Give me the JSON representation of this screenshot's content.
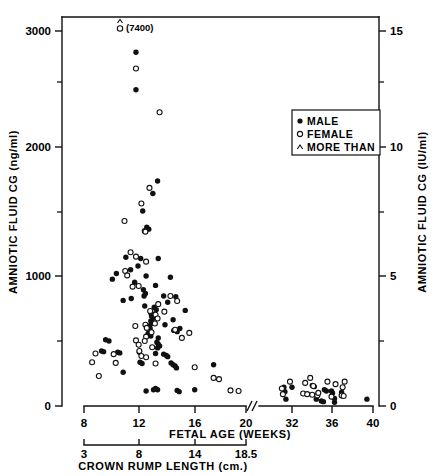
{
  "chart_data": {
    "type": "scatter",
    "title": "",
    "xlabel": "FETAL AGE (WEEKS)",
    "ylabel": "AMNIOTIC FLUID CG (ng/ml)",
    "ylabel_right": "AMNIOTIC FLUID CG (IU/ml)",
    "xlabel_secondary": "CROWN RUMP LENGTH (cm.)",
    "grid": false,
    "legend_position": "upper-right",
    "axis_break": true,
    "axis_break_note": "//",
    "ylim": [
      0,
      3200
    ],
    "ylim_right": [
      0,
      16
    ],
    "y_ticks": [
      0,
      1000,
      2000,
      3000
    ],
    "y_minor_ticks": [
      500,
      1500,
      2500
    ],
    "y_ticks_right": [
      0,
      5,
      10,
      15
    ],
    "y_minor_ticks_right": [
      2.5,
      7.5,
      12.5
    ],
    "x_ticks_left_segment": [
      8,
      12,
      16,
      20
    ],
    "x_ticks_right_segment": [
      32,
      36,
      40
    ],
    "x_ticks_secondary": [
      "3",
      "8",
      "14",
      "18.5"
    ],
    "annotations": [
      {
        "text": "(7400)",
        "symbol": "more-than-female",
        "x_week": 12.0,
        "y_label": 3150
      }
    ],
    "legend": [
      {
        "symbol": "filled-circle",
        "label": "MALE"
      },
      {
        "symbol": "open-circle",
        "label": "FEMALE"
      },
      {
        "symbol": "caret",
        "label": "MORE THAN"
      }
    ],
    "series": [
      {
        "name": "MALE",
        "marker": "filled-circle",
        "points": [
          [
            11.85,
            2830
          ],
          [
            11.85,
            2530
          ],
          [
            13.45,
            1800
          ],
          [
            13.1,
            1700
          ],
          [
            12.35,
            1560
          ],
          [
            12.65,
            1430
          ],
          [
            12.8,
            1415
          ],
          [
            11.1,
            1190
          ],
          [
            12.2,
            1180
          ],
          [
            13.5,
            1180
          ],
          [
            12.0,
            1120
          ],
          [
            11.45,
            1090
          ],
          [
            10.4,
            1060
          ],
          [
            12.6,
            1040
          ],
          [
            14.4,
            1030
          ],
          [
            10.1,
            1015
          ],
          [
            11.75,
            990
          ],
          [
            13.3,
            965
          ],
          [
            12.4,
            930
          ],
          [
            12.55,
            900
          ],
          [
            12.45,
            880
          ],
          [
            13.9,
            880
          ],
          [
            14.8,
            875
          ],
          [
            11.5,
            860
          ],
          [
            10.9,
            845
          ],
          [
            14.2,
            830
          ],
          [
            12.5,
            800
          ],
          [
            13.2,
            790
          ],
          [
            13.35,
            770
          ],
          [
            15.5,
            765
          ],
          [
            12.95,
            745
          ],
          [
            13.05,
            735
          ],
          [
            13.0,
            720
          ],
          [
            13.1,
            700
          ],
          [
            14.6,
            690
          ],
          [
            12.95,
            680
          ],
          [
            13.0,
            660
          ],
          [
            14.0,
            650
          ],
          [
            12.85,
            640
          ],
          [
            12.9,
            620
          ],
          [
            15.1,
            620
          ],
          [
            14.65,
            605
          ],
          [
            14.9,
            595
          ],
          [
            12.75,
            580
          ],
          [
            12.95,
            560
          ],
          [
            13.5,
            545
          ],
          [
            9.6,
            530
          ],
          [
            9.85,
            520
          ],
          [
            13.4,
            510
          ],
          [
            13.5,
            495
          ],
          [
            13.6,
            480
          ],
          [
            13.45,
            465
          ],
          [
            9.3,
            440
          ],
          [
            9.45,
            435
          ],
          [
            10.5,
            430
          ],
          [
            10.65,
            425
          ],
          [
            12.1,
            430
          ],
          [
            13.3,
            420
          ],
          [
            13.9,
            415
          ],
          [
            14.1,
            405
          ],
          [
            14.2,
            395
          ],
          [
            12.15,
            350
          ],
          [
            12.3,
            340
          ],
          [
            14.45,
            345
          ],
          [
            14.6,
            330
          ],
          [
            14.75,
            320
          ],
          [
            14.85,
            305
          ],
          [
            17.6,
            330
          ],
          [
            10.9,
            270
          ],
          [
            13.3,
            140
          ],
          [
            13.45,
            130
          ],
          [
            13.15,
            130
          ],
          [
            12.6,
            120
          ],
          [
            14.9,
            125
          ],
          [
            15.05,
            115
          ],
          [
            16.2,
            130
          ],
          [
            31.2,
            150
          ],
          [
            31.3,
            115
          ],
          [
            32.0,
            150
          ],
          [
            34.0,
            165
          ],
          [
            34.2,
            155
          ],
          [
            35.2,
            130
          ],
          [
            35.4,
            120
          ],
          [
            35.9,
            120
          ],
          [
            36.0,
            105
          ],
          [
            36.2,
            60
          ],
          [
            36.9,
            110
          ],
          [
            34.4,
            55
          ],
          [
            34.9,
            40
          ],
          [
            35.1,
            35
          ],
          [
            36.2,
            30
          ],
          [
            31.4,
            55
          ],
          [
            39.4,
            55
          ]
        ]
      },
      {
        "name": "FEMALE",
        "marker": "open-circle",
        "points": [
          [
            11.85,
            2700
          ],
          [
            13.6,
            2350
          ],
          [
            12.85,
            1745
          ],
          [
            12.25,
            1620
          ],
          [
            11.0,
            1480
          ],
          [
            12.5,
            1400
          ],
          [
            12.55,
            1395
          ],
          [
            11.45,
            1230
          ],
          [
            11.85,
            1195
          ],
          [
            12.6,
            1155
          ],
          [
            11.05,
            1080
          ],
          [
            11.2,
            1045
          ],
          [
            12.05,
            960
          ],
          [
            11.6,
            955
          ],
          [
            14.4,
            880
          ],
          [
            14.9,
            840
          ],
          [
            13.5,
            815
          ],
          [
            12.9,
            760
          ],
          [
            13.95,
            755
          ],
          [
            13.3,
            730
          ],
          [
            13.45,
            700
          ],
          [
            13.25,
            660
          ],
          [
            12.55,
            650
          ],
          [
            11.8,
            640
          ],
          [
            12.65,
            625
          ],
          [
            14.75,
            610
          ],
          [
            13.0,
            590
          ],
          [
            15.8,
            585
          ],
          [
            12.6,
            555
          ],
          [
            15.25,
            545
          ],
          [
            11.85,
            525
          ],
          [
            12.5,
            520
          ],
          [
            12.05,
            490
          ],
          [
            13.05,
            470
          ],
          [
            12.1,
            440
          ],
          [
            8.85,
            420
          ],
          [
            10.2,
            415
          ],
          [
            12.25,
            400
          ],
          [
            12.6,
            390
          ],
          [
            8.6,
            350
          ],
          [
            10.35,
            345
          ],
          [
            13.3,
            340
          ],
          [
            16.2,
            310
          ],
          [
            9.1,
            240
          ],
          [
            17.6,
            225
          ],
          [
            18.0,
            215
          ],
          [
            18.85,
            125
          ],
          [
            19.45,
            120
          ],
          [
            31.0,
            140
          ],
          [
            31.8,
            195
          ],
          [
            33.3,
            185
          ],
          [
            33.8,
            225
          ],
          [
            34.1,
            160
          ],
          [
            35.5,
            195
          ],
          [
            36.3,
            175
          ],
          [
            37.2,
            195
          ],
          [
            37.0,
            150
          ],
          [
            33.1,
            100
          ],
          [
            33.5,
            95
          ],
          [
            34.0,
            90
          ],
          [
            34.5,
            85
          ],
          [
            35.9,
            75
          ],
          [
            36.9,
            85
          ],
          [
            37.1,
            80
          ],
          [
            31.1,
            95
          ],
          [
            34.6,
            105
          ]
        ]
      }
    ]
  },
  "axes": {
    "left": {
      "title": "AMNIOTIC FLUID CG  (ng/ml)",
      "labels": [
        "0",
        "1000",
        "2000",
        "3000"
      ]
    },
    "right": {
      "title": "AMNIOTIC FLUID CG  (IU/ml)",
      "labels": [
        "0",
        "5",
        "10",
        "15"
      ]
    },
    "bottom_primary": {
      "title": "FETAL AGE  (WEEKS)",
      "labels": [
        "8",
        "12",
        "16",
        "20",
        "32",
        "36",
        "40"
      ]
    },
    "bottom_secondary": {
      "title": "CROWN RUMP LENGTH  (cm.)",
      "labels": [
        "3",
        "8",
        "14",
        "18.5"
      ]
    }
  },
  "legend": {
    "items": [
      {
        "label": "MALE"
      },
      {
        "label": "FEMALE"
      },
      {
        "label": "MORE THAN"
      }
    ]
  },
  "annotation": {
    "text": "(7400)"
  },
  "colors": {
    "ink": "#111111",
    "background": "#ffffff"
  }
}
